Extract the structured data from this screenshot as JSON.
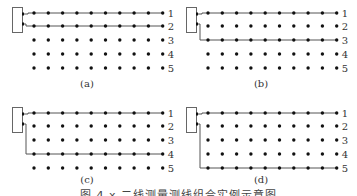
{
  "figure": {
    "caption": "图 4.x  二线测量测线组合实例示意图",
    "row_labels": [
      "1",
      "2",
      "3",
      "4",
      "5"
    ],
    "dots_per_row": 10,
    "panels": [
      {
        "id": "a",
        "label": "(a)",
        "connected_rows": [
          1,
          2
        ]
      },
      {
        "id": "b",
        "label": "(b)",
        "connected_rows": [
          1,
          3
        ]
      },
      {
        "id": "c",
        "label": "(c)",
        "connected_rows": [
          1,
          4
        ]
      },
      {
        "id": "d",
        "label": "(d)",
        "connected_rows": [
          1,
          5
        ]
      }
    ],
    "colors": {
      "line": "#555555",
      "dot": "#111111",
      "box": "#666666",
      "text": "#333333"
    }
  }
}
